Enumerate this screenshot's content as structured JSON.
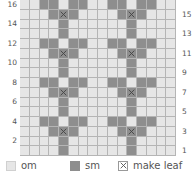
{
  "chart": {
    "columns": 16,
    "rows": 16,
    "colors": {
      "om": "#e6e6e6",
      "sm": "#8e8e8e",
      "grid": "#b5b5b5"
    },
    "left_row_labels": [
      "16",
      "14",
      "12",
      "10",
      "8",
      "6",
      "4",
      "2"
    ],
    "right_row_labels": [
      "15",
      "13",
      "11",
      "9",
      "7",
      "5",
      "3",
      "1"
    ],
    "pattern_rows_top_to_bottom": [
      "..ss.ss..ss.ss..",
      "...sxs....sxs...",
      "....s......s....",
      "....s......s....",
      "..ss.ss..ss.ss..",
      "...sxs....sxs...",
      "....s......s....",
      "....s......s....",
      "..ss.ss..ss.ss..",
      "...sxs....sxs...",
      "....s......s....",
      "....s......s....",
      "..ss.ss..ss.ss..",
      "...sxs....sxs...",
      "....s......s....",
      "....s......s...."
    ]
  },
  "legend": {
    "items": [
      {
        "key": "om",
        "label": "om"
      },
      {
        "key": "sm",
        "label": "sm"
      },
      {
        "key": "leaf",
        "label": "make leaf"
      }
    ]
  }
}
